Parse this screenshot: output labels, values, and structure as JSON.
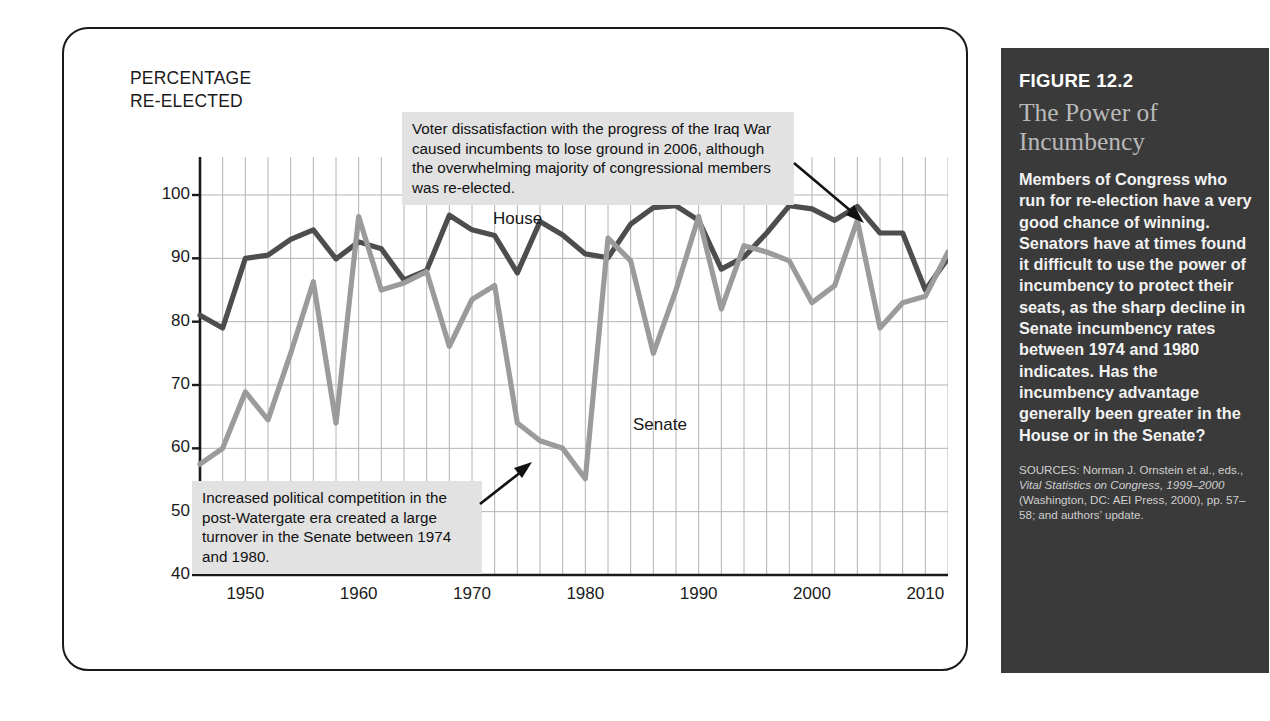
{
  "axis_title": "PERCENTAGE\nRE-ELECTED",
  "callouts": {
    "iraq": "Voter dissatisfaction with the progress of the Iraq War caused incumbents to lose ground in 2006, although the overwhelming majority of congressional members was re-elected.",
    "watergate": "Increased political competition in the post-Watergate era created a large turnover in the Senate between 1974 and 1980."
  },
  "series_labels": {
    "house": "House",
    "senate": "Senate"
  },
  "sidebar": {
    "figure_number": "FIGURE 12.2",
    "title": "The Power of\nIncumbency",
    "body": "Members of Congress who run for re-election have a very good chance of winning. Senators have at times found it difficult to use the power of incumbency to protect their seats, as the sharp decline in Senate incumbency rates between 1974 and 1980 indicates. Has the incumbency advantage generally been greater in the House or in the Senate?",
    "sources_prefix": "SOURCES: Norman J. Ornstein et al., eds., ",
    "sources_italic": "Vital Statistics on Congress, 1999–2000",
    "sources_suffix": " (Washington, DC: AEI Press, 2000), pp. 57–58; and authors’ update."
  },
  "colors": {
    "house_line": "#4d4d4d",
    "senate_line": "#9b9b9b",
    "grid": "#b4b4b4",
    "axis": "#1a1a1a",
    "callout_bg": "#e2e2e2",
    "sidebar_bg": "#3a3a3a",
    "sidebar_title": "#b9b9b9"
  },
  "chart_data": {
    "type": "line",
    "title": "The Power of Incumbency",
    "xlabel": "",
    "ylabel": "PERCENTAGE RE-ELECTED",
    "xlim": [
      1946,
      2012
    ],
    "ylim": [
      40,
      106
    ],
    "yticks": [
      40,
      50,
      60,
      70,
      80,
      90,
      100
    ],
    "xticks": [
      1950,
      1960,
      1970,
      1980,
      1990,
      2000,
      2010
    ],
    "grid": true,
    "grid_x_step": 2,
    "legend": "inline-labels",
    "x": [
      1946,
      1948,
      1950,
      1952,
      1954,
      1956,
      1958,
      1960,
      1962,
      1964,
      1966,
      1968,
      1970,
      1972,
      1974,
      1976,
      1978,
      1980,
      1982,
      1984,
      1986,
      1988,
      1990,
      1992,
      1994,
      1996,
      1998,
      2000,
      2002,
      2004,
      2006,
      2008,
      2010,
      2012
    ],
    "series": [
      {
        "name": "House",
        "color": "#4d4d4d",
        "values": [
          81,
          79,
          90,
          90.5,
          93,
          94.5,
          89.9,
          92.6,
          91.5,
          86.6,
          88.1,
          96.8,
          94.5,
          93.6,
          87.7,
          95.8,
          93.7,
          90.7,
          90.1,
          95.4,
          98.0,
          98.3,
          96.0,
          88.3,
          90.2,
          94.0,
          98.3,
          97.8,
          96.0,
          98.2,
          94.0,
          94.0,
          85.0,
          90.0
        ]
      },
      {
        "name": "Senate",
        "color": "#9b9b9b",
        "values": [
          57.5,
          60.0,
          68.9,
          64.5,
          75.0,
          86.3,
          64.0,
          96.6,
          85.0,
          86.1,
          87.9,
          76.1,
          83.5,
          85.7,
          64.0,
          61.2,
          60.0,
          55.2,
          93.2,
          89.6,
          75.0,
          85.0,
          96.6,
          82.0,
          92.0,
          91.0,
          89.6,
          83.0,
          85.7,
          96.0,
          79.0,
          83.0,
          84.0,
          91.0
        ]
      }
    ],
    "annotations": [
      {
        "text": "Voter dissatisfaction with the progress of the Iraq War caused incumbents to lose ground in 2006, although the overwhelming majority of congressional members was re-elected.",
        "points_to_year": 2006
      },
      {
        "text": "Increased political competition in the post-Watergate era created a large turnover in the Senate between 1974 and 1980.",
        "points_to_year": 1976
      }
    ]
  }
}
